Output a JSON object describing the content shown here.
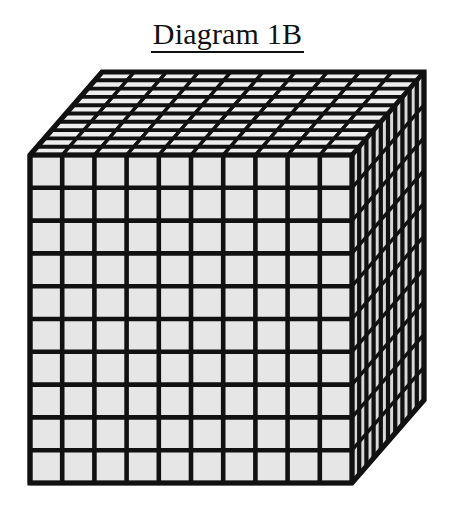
{
  "canvas": {
    "width": 455,
    "height": 513,
    "background": "#ffffff"
  },
  "title": {
    "text": "Diagram 1B",
    "underlined": true,
    "align": "center",
    "color": "#111111"
  },
  "figure": {
    "name": "base-ten-thousands-cube",
    "units_per_edge": 10,
    "total_units": 1000,
    "faces": [
      "front",
      "top",
      "right"
    ],
    "colors": {
      "cell_fill": "#e6e6e6",
      "line": "#111111",
      "cell_fill_top": "#ededed",
      "cell_fill_right": "#d9d9d9"
    },
    "geometry": {
      "front_left": 30,
      "front_right": 352,
      "front_top": 155,
      "front_bottom": 483,
      "depth_dx": 72,
      "depth_dy": -83,
      "line_width_front": 4.6,
      "line_width_top": 3.4,
      "line_width_right": 3.4,
      "outline_width": 5.2
    },
    "grid": {
      "front_rows": 10,
      "front_cols": 10,
      "top_rows": 10,
      "top_cols": 10,
      "right_rows": 10,
      "right_cols": 10
    }
  }
}
